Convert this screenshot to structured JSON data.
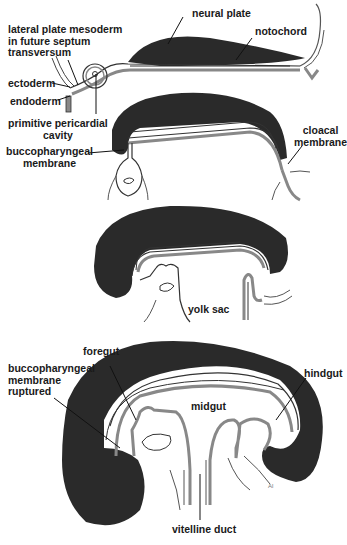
{
  "colors": {
    "ectoderm_fill": "#2a2a2a",
    "endoderm_stripe": "#8a8a8a",
    "outline": "#333333",
    "background": "#ffffff",
    "leader_line": "#111111"
  },
  "stage1": {
    "labels": {
      "lateral_plate": "lateral plate mesoderm\nin future septum\ntransversum",
      "ectoderm": "ectoderm",
      "endoderm": "endoderm",
      "pericardial": "primitive pericardial\ncavity",
      "neural_plate": "neural plate",
      "notochord": "notochord"
    }
  },
  "stage2": {
    "labels": {
      "buccopharyngeal": "buccopharyngeal\nmembrane",
      "cloacal": "cloacal\nmembrane"
    }
  },
  "stage3": {
    "labels": {
      "yolk_sac": "yolk sac"
    }
  },
  "stage4": {
    "labels": {
      "foregut": "foregut",
      "bucco_ruptured": "buccopharyngeal\nmembrane\nruptured",
      "hindgut": "hindgut",
      "midgut": "midgut",
      "vitelline_duct": "vitelline duct"
    }
  }
}
